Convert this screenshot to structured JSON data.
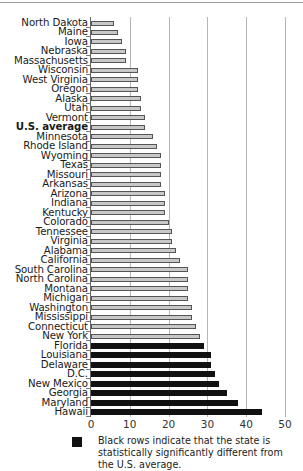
{
  "chart_data": {
    "type": "bar",
    "orientation": "horizontal",
    "title": "",
    "xlabel": "",
    "ylabel": "",
    "xlim": [
      0,
      50
    ],
    "x_ticks": [
      0,
      10,
      20,
      30,
      40,
      50
    ],
    "grid": true,
    "categories": [
      "North Dakota",
      "Maine",
      "Iowa",
      "Nebraska",
      "Massachusetts",
      "Wisconsin",
      "West Virginia",
      "Oregon",
      "Alaska",
      "Utah",
      "Vermont",
      "U.S. average",
      "Minnesota",
      "Rhode Island",
      "Wyoming",
      "Texas",
      "Missouri",
      "Arkansas",
      "Arizona",
      "Indiana",
      "Kentucky",
      "Colorado",
      "Tennessee",
      "Virginia",
      "Alabama",
      "California",
      "South Carolina",
      "North Carolina",
      "Montana",
      "Michigan",
      "Washington",
      "Mississippi",
      "Connecticut",
      "New York",
      "Florida",
      "Louisiana",
      "Delaware",
      "D.C.",
      "New Mexico",
      "Georgia",
      "Maryland",
      "Hawaii"
    ],
    "values": [
      6,
      7,
      8,
      9,
      9,
      12,
      12,
      12,
      13,
      13,
      14,
      14,
      16,
      17,
      18,
      18,
      18,
      18,
      19,
      19,
      19,
      20,
      21,
      21,
      22,
      23,
      25,
      25,
      25,
      25,
      26,
      26,
      27,
      28,
      29,
      31,
      31,
      32,
      33,
      35,
      38,
      44
    ],
    "significant": [
      false,
      false,
      false,
      false,
      false,
      false,
      false,
      false,
      false,
      false,
      false,
      false,
      false,
      false,
      false,
      false,
      false,
      false,
      false,
      false,
      false,
      false,
      false,
      false,
      false,
      false,
      false,
      false,
      false,
      false,
      false,
      false,
      false,
      false,
      true,
      true,
      true,
      true,
      true,
      true,
      true,
      true
    ],
    "highlight_category": "U.S. average",
    "legend": {
      "position": "bottom",
      "entries": [
        {
          "swatch_color": "#111111",
          "text": "Black rows indicate that the state is statistically significantly different from the U.S. average."
        }
      ]
    },
    "colors": {
      "normal_bar": "#c8c8c8",
      "normal_border": "#555555",
      "significant_bar": "#111111",
      "gridline": "#b5b5b5"
    }
  },
  "legend": {
    "text": "Black rows indicate that the state is statistically significantly different from the U.S. average."
  }
}
